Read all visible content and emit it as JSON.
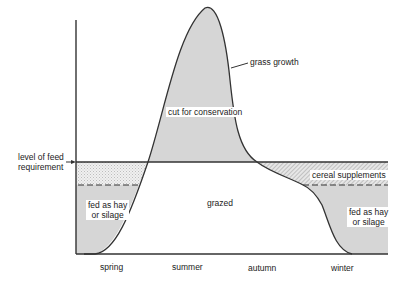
{
  "diagram": {
    "type": "grass growth vs feed requirement over seasons",
    "labels": {
      "feed_requirement": [
        "level of feed",
        "requirement"
      ],
      "grass_growth": "grass growth",
      "cut_for_conservation": "cut for conservation",
      "grazed": "grazed",
      "cereal_supplements": "cereal supplements",
      "fed_left": [
        "fed as hay",
        "or silage"
      ],
      "fed_right": [
        "fed as hay",
        "or silage"
      ]
    },
    "x_axis": {
      "seasons": [
        "spring",
        "summer",
        "autumn",
        "winter"
      ]
    },
    "colors": {
      "line": "#333333",
      "shade": "#d4d4d4",
      "light_shade": "#e8e8e8"
    }
  }
}
